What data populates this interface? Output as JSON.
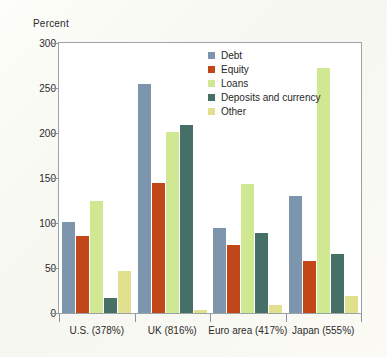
{
  "chart_data": {
    "type": "bar",
    "title": "",
    "subtitle": "",
    "xlabel": "",
    "ylabel": "Percent",
    "ylim": [
      0,
      300
    ],
    "yticks": [
      0,
      50,
      100,
      150,
      200,
      250,
      300
    ],
    "ytick_labels": [
      "0",
      "50",
      "100",
      "150",
      "200",
      "250",
      "300"
    ],
    "grid": false,
    "legend_position": "top-right",
    "categories": [
      "U.S. (378%)",
      "UK (816%)",
      "Euro area (417%)",
      "Japan (555%)"
    ],
    "series": [
      {
        "name": "Debt",
        "color": "#7d96ad",
        "values": [
          101,
          254,
          94,
          130
        ]
      },
      {
        "name": "Equity",
        "color": "#c14618",
        "values": [
          86,
          145,
          76,
          58
        ]
      },
      {
        "name": "Loans",
        "color": "#cfe891",
        "values": [
          124,
          201,
          143,
          272
        ]
      },
      {
        "name": "Deposits and currency",
        "color": "#466f67",
        "values": [
          17,
          209,
          89,
          66
        ]
      },
      {
        "name": "Other",
        "color": "#e0e08f",
        "values": [
          47,
          3,
          9,
          19
        ]
      }
    ]
  },
  "colors": {
    "debt": "#7d96ad",
    "equity": "#c14618",
    "loans": "#cfe891",
    "deposits": "#466f67",
    "other": "#e0e08f",
    "axis": "#8a9297",
    "text": "#2b2b2b",
    "plot_background": "#ffffff",
    "page_background": "#fbfbf7"
  }
}
